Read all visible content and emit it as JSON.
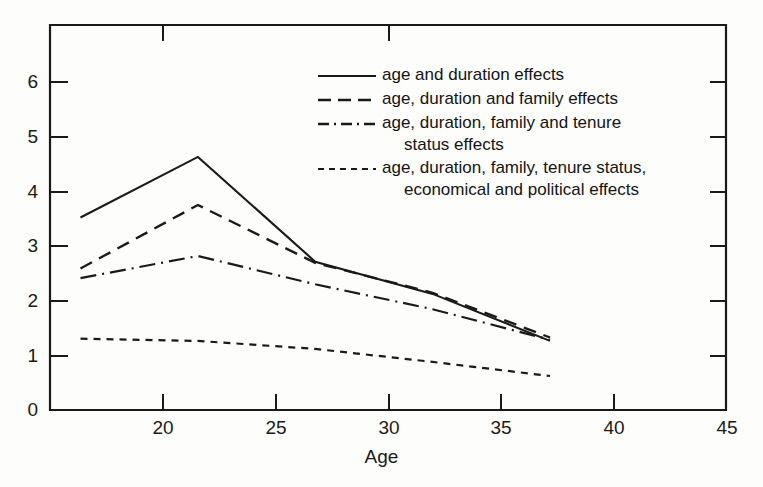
{
  "chart_data": {
    "type": "line",
    "title": "",
    "xlabel": "Age",
    "ylabel": "",
    "xlim": [
      16.2,
      45
    ],
    "ylim": [
      0,
      6.8
    ],
    "xticks": [
      20,
      25,
      30,
      35,
      40,
      45
    ],
    "yticks": [
      0,
      1,
      2,
      3,
      4,
      5,
      6
    ],
    "grid": false,
    "legend_position": "upper-center-right",
    "x": [
      17.5,
      22.5,
      27.5,
      32.5,
      37.5
    ],
    "series": [
      {
        "name": "age and duration effects",
        "style": "solid",
        "values": [
          3.4,
          4.47,
          2.62,
          2.05,
          1.22
        ]
      },
      {
        "name": "age, duration and family effects",
        "style": "dashed",
        "values": [
          2.5,
          3.62,
          2.6,
          2.07,
          1.28
        ]
      },
      {
        "name": "age, duration, family and tenure status effects",
        "style": "dash-dot",
        "values": [
          2.33,
          2.72,
          2.22,
          1.78,
          1.24
        ]
      },
      {
        "name": "age, duration, family, tenure status, economical and political effects",
        "style": "dotted",
        "values": [
          1.26,
          1.22,
          1.08,
          0.85,
          0.6
        ]
      }
    ]
  },
  "axes": {
    "x_title": "Age",
    "x_tick_labels": [
      "20",
      "25",
      "30",
      "35",
      "40",
      "45"
    ],
    "y_tick_labels": [
      "0",
      "1",
      "2",
      "3",
      "4",
      "5",
      "6"
    ]
  },
  "legend": {
    "entries": [
      {
        "style": "solid",
        "line1": "age and duration effects",
        "line2": ""
      },
      {
        "style": "dashed",
        "line1": "age, duration and family effects",
        "line2": ""
      },
      {
        "style": "dash-dot",
        "line1": "age, duration, family and tenure",
        "line2": "status effects"
      },
      {
        "style": "dotted",
        "line1": "age, duration, family, tenure status,",
        "line2": "economical and political effects"
      }
    ]
  },
  "colors": {
    "line": "#1a1a1a",
    "axis": "#1a1a1a",
    "background": "#fdfdfc"
  }
}
